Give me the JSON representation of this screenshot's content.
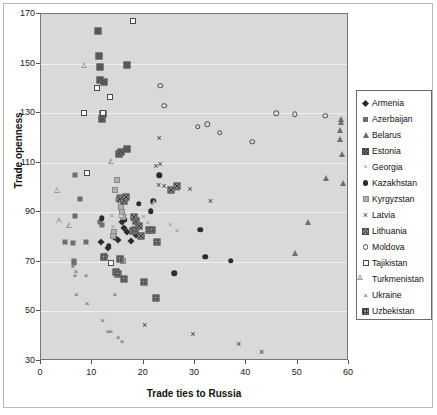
{
  "chart_data": {
    "type": "scatter",
    "title": "",
    "xlabel": "Trade ties to Russia",
    "ylabel": "Trade openness",
    "xlim": [
      0,
      60
    ],
    "ylim": [
      30,
      170
    ],
    "xticks": [
      0,
      10,
      20,
      30,
      40,
      50,
      60
    ],
    "yticks": [
      30,
      50,
      70,
      90,
      110,
      130,
      150,
      170
    ],
    "grid": true,
    "legend_position": "right",
    "plot_background": "#d9d9d9",
    "series": [
      {
        "name": "Armenia",
        "marker": "filled-diamond",
        "color": "#2b2b2b",
        "points": [
          [
            11.6,
            78.0
          ],
          [
            12.4,
            72.5
          ],
          [
            13.1,
            75.5
          ],
          [
            14.2,
            80.0
          ],
          [
            15.0,
            79.0
          ],
          [
            15.8,
            86.0
          ],
          [
            16.2,
            83.5
          ],
          [
            16.8,
            82.0
          ],
          [
            18.6,
            81.0
          ],
          [
            19.2,
            80.5
          ],
          [
            17.5,
            78.5
          ]
        ]
      },
      {
        "name": "Azerbaijan",
        "marker": "filled-square",
        "color": "#6e6e6e",
        "points": [
          [
            4.6,
            78.0
          ],
          [
            6.2,
            77.5
          ],
          [
            6.6,
            105.0
          ],
          [
            6.7,
            88.5
          ],
          [
            7.6,
            95.5
          ],
          [
            8.8,
            78.0
          ],
          [
            11.4,
            86.0
          ],
          [
            11.8,
            85.0
          ],
          [
            6.4,
            70.5
          ],
          [
            6.5,
            69.5
          ]
        ]
      },
      {
        "name": "Belarus",
        "marker": "filled-triangle",
        "color": "#6e6e6e",
        "points": [
          [
            52.0,
            86.0
          ],
          [
            55.5,
            104.0
          ],
          [
            58.8,
            102.0
          ],
          [
            58.6,
            113.5
          ],
          [
            58.2,
            119.5
          ],
          [
            58.3,
            123.0
          ],
          [
            58.4,
            126.5
          ],
          [
            58.5,
            127.5
          ],
          [
            49.5,
            73.5
          ]
        ]
      },
      {
        "name": "Estonia",
        "marker": "hatch-square",
        "color": "#8a8a8a",
        "points": [
          [
            11.2,
            163.0
          ],
          [
            11.3,
            153.0
          ],
          [
            11.4,
            148.5
          ],
          [
            11.5,
            143.5
          ],
          [
            11.9,
            127.5
          ],
          [
            12.0,
            129.5
          ],
          [
            16.7,
            149.5
          ],
          [
            15.2,
            113.5
          ],
          [
            15.5,
            114.5
          ],
          [
            16.8,
            115.5
          ],
          [
            12.3,
            142.5
          ]
        ]
      },
      {
        "name": "Georgia",
        "marker": "small-x",
        "color": "#8f8f8f",
        "points": [
          [
            14.6,
            95.0
          ],
          [
            15.2,
            92.0
          ],
          [
            16.0,
            95.5
          ],
          [
            16.4,
            89.0
          ],
          [
            20.0,
            88.0
          ],
          [
            20.8,
            85.5
          ],
          [
            25.2,
            85.0
          ],
          [
            26.5,
            82.5
          ],
          [
            13.8,
            88.5
          ],
          [
            14.0,
            84.0
          ]
        ]
      },
      {
        "name": "Kazakhstan",
        "marker": "filled-circle",
        "color": "#2b2b2b",
        "points": [
          [
            11.8,
            87.5
          ],
          [
            13.2,
            76.5
          ],
          [
            16.3,
            87.0
          ],
          [
            19.0,
            93.5
          ],
          [
            21.4,
            90.5
          ],
          [
            21.9,
            94.5
          ],
          [
            23.0,
            105.0
          ],
          [
            26.0,
            65.5
          ],
          [
            31.0,
            83.0
          ],
          [
            32.0,
            72.0
          ],
          [
            37.0,
            70.5
          ]
        ]
      },
      {
        "name": "Kyrgyzstan",
        "marker": "light-square",
        "color": "#b0b0b0",
        "points": [
          [
            14.5,
            99.0
          ],
          [
            14.8,
            103.0
          ],
          [
            15.4,
            96.0
          ],
          [
            15.6,
            92.0
          ],
          [
            15.8,
            90.0
          ],
          [
            16.0,
            88.0
          ],
          [
            14.2,
            82.0
          ],
          [
            14.0,
            80.5
          ],
          [
            15.5,
            71.0
          ],
          [
            16.0,
            70.5
          ],
          [
            12.0,
            71.5
          ],
          [
            12.2,
            72.5
          ]
        ]
      },
      {
        "name": "Latvia",
        "marker": "x",
        "color": "#3a3a3a",
        "points": [
          [
            22.4,
            108.5
          ],
          [
            23.2,
            109.5
          ],
          [
            23.0,
            120.0
          ],
          [
            22.9,
            101.0
          ],
          [
            24.0,
            100.5
          ],
          [
            26.5,
            99.5
          ],
          [
            29.0,
            99.5
          ],
          [
            33.0,
            94.5
          ],
          [
            20.2,
            44.5
          ],
          [
            29.6,
            41.0
          ],
          [
            38.5,
            37.0
          ],
          [
            43.0,
            33.5
          ]
        ]
      },
      {
        "name": "Lithuania",
        "marker": "cross-square",
        "color": "#909090",
        "points": [
          [
            15.3,
            95.5
          ],
          [
            16.2,
            94.5
          ],
          [
            16.6,
            96.0
          ],
          [
            18.2,
            88.0
          ],
          [
            18.6,
            86.5
          ],
          [
            19.0,
            84.5
          ],
          [
            21.0,
            83.0
          ],
          [
            25.3,
            99.0
          ],
          [
            26.4,
            100.5
          ],
          [
            19.4,
            80.5
          ],
          [
            18.0,
            82.5
          ]
        ]
      },
      {
        "name": "Moldova",
        "marker": "open-circle",
        "color": "#4a4a4a",
        "points": [
          [
            23.2,
            141.0
          ],
          [
            24.0,
            133.0
          ],
          [
            30.5,
            124.5
          ],
          [
            32.4,
            125.5
          ],
          [
            34.8,
            122.0
          ],
          [
            41.2,
            118.5
          ],
          [
            45.8,
            130.0
          ],
          [
            49.4,
            129.5
          ],
          [
            55.4,
            129.0
          ]
        ]
      },
      {
        "name": "Tajikistan",
        "marker": "open-square",
        "color": "#4a4a4a",
        "points": [
          [
            18.0,
            167.0
          ],
          [
            11.0,
            140.0
          ],
          [
            13.4,
            136.5
          ],
          [
            8.4,
            130.0
          ],
          [
            12.0,
            130.0
          ],
          [
            9.0,
            106.0
          ],
          [
            13.6,
            69.5
          ]
        ]
      },
      {
        "name": "Turkmenistan",
        "marker": "open-triangle",
        "color": "#9a9a9a",
        "points": [
          [
            8.4,
            149.5
          ],
          [
            13.8,
            113.0
          ],
          [
            3.2,
            104.0
          ],
          [
            3.6,
            94.0
          ],
          [
            5.6,
            94.5
          ],
          [
            15.6,
            101.0
          ],
          [
            22.2,
            108.5
          ]
        ]
      },
      {
        "name": "Ukraine",
        "marker": "thin-x",
        "color": "#5a5a5a",
        "points": [
          [
            6.2,
            68.5
          ],
          [
            6.8,
            66.5
          ],
          [
            6.6,
            64.5
          ],
          [
            8.8,
            64.5
          ],
          [
            6.9,
            57.0
          ],
          [
            9.0,
            53.5
          ],
          [
            14.4,
            57.0
          ],
          [
            12.0,
            46.5
          ],
          [
            13.0,
            42.0
          ],
          [
            13.6,
            42.0
          ],
          [
            15.0,
            39.5
          ],
          [
            15.8,
            38.0
          ]
        ]
      },
      {
        "name": "Uzbekistan",
        "marker": "grid-square",
        "color": "#9d9d9d",
        "points": [
          [
            12.2,
            72.0
          ],
          [
            14.6,
            66.0
          ],
          [
            15.0,
            65.0
          ],
          [
            16.2,
            63.0
          ],
          [
            20.0,
            62.0
          ],
          [
            22.4,
            55.5
          ],
          [
            22.6,
            78.0
          ],
          [
            18.4,
            83.0
          ],
          [
            21.6,
            83.0
          ],
          [
            15.4,
            71.0
          ]
        ]
      }
    ]
  },
  "legend": {
    "entries": [
      {
        "label": "Armenia",
        "marker": "filled-diamond"
      },
      {
        "label": "Azerbaijan",
        "marker": "filled-square"
      },
      {
        "label": "Belarus",
        "marker": "filled-triangle"
      },
      {
        "label": "Estonia",
        "marker": "hatch-square"
      },
      {
        "label": "Georgia",
        "marker": "small-x"
      },
      {
        "label": "Kazakhstan",
        "marker": "filled-circle"
      },
      {
        "label": "Kyrgyzstan",
        "marker": "light-square"
      },
      {
        "label": "Latvia",
        "marker": "x"
      },
      {
        "label": "Lithuania",
        "marker": "cross-square"
      },
      {
        "label": "Moldova",
        "marker": "open-circle"
      },
      {
        "label": "Tajikistan",
        "marker": "open-square"
      },
      {
        "label": "Turkmenistan",
        "marker": "open-triangle"
      },
      {
        "label": "Ukraine",
        "marker": "thin-x"
      },
      {
        "label": "Uzbekistan",
        "marker": "grid-square"
      }
    ]
  }
}
